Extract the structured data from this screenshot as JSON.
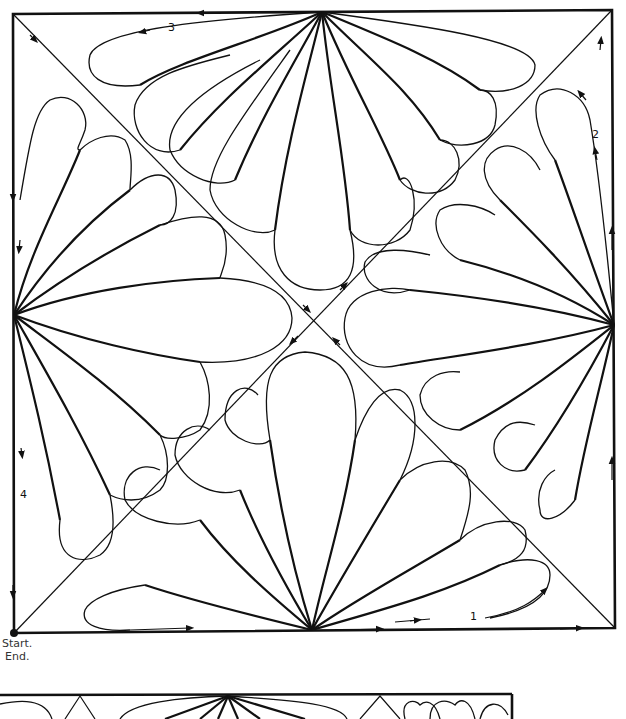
{
  "diagram": {
    "path_numbers": {
      "n1": "1",
      "n2": "2",
      "n3": "3",
      "n4": "4"
    },
    "start_label": "Start.",
    "end_label": "End."
  },
  "colors": {
    "stroke": "#111111",
    "background": "#ffffff"
  }
}
